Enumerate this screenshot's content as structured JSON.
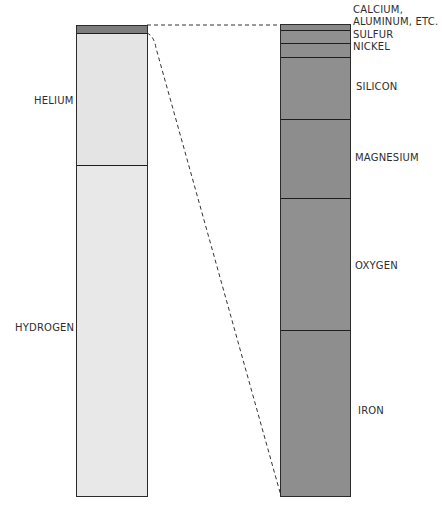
{
  "colors": {
    "light_fill": "#e6e6e6",
    "dark_fill": "#8f8f8f",
    "cap_fill": "#7d7d7d",
    "outline": "#2b2b2b"
  },
  "left_column": {
    "title": "Whole composition",
    "segments": [
      {
        "label": "",
        "top": 0,
        "height": 8
      },
      {
        "label": "HELIUM",
        "top": 8,
        "height": 132
      },
      {
        "label": "HYDROGEN",
        "top": 140,
        "height": 331
      }
    ]
  },
  "right_column": {
    "segments": [
      {
        "label": "CALCIUM,",
        "label2": "ALUMINUM, ETC.",
        "top": 0,
        "height": 5
      },
      {
        "label": "SULFUR",
        "top": 5,
        "height": 13
      },
      {
        "label": "NICKEL",
        "top": 18,
        "height": 14
      },
      {
        "label": "SILICON",
        "top": 32,
        "height": 62
      },
      {
        "label": "MAGNESIUM",
        "top": 94,
        "height": 79
      },
      {
        "label": "OXYGEN",
        "top": 173,
        "height": 132
      },
      {
        "label": "IRON",
        "top": 305,
        "height": 166
      }
    ]
  },
  "labels": {
    "calcium": "CALCIUM,",
    "aluminum": "ALUMINUM, ETC.",
    "sulfur": "SULFUR",
    "nickel": "NICKEL",
    "silicon": "SILICON",
    "magnesium": "MAGNESIUM",
    "oxygen": "OXYGEN",
    "iron": "IRON",
    "helium": "HELIUM",
    "hydrogen": "HYDROGEN"
  }
}
